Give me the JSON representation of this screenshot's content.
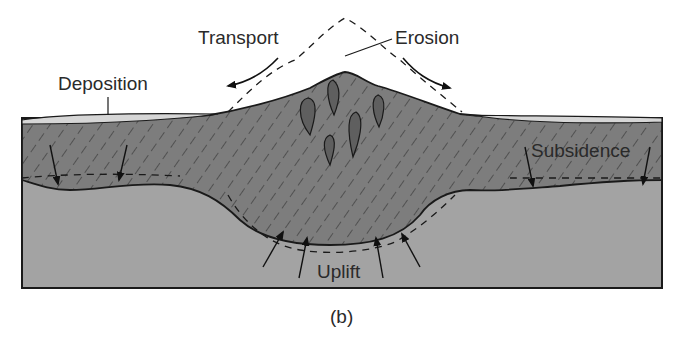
{
  "figure": {
    "caption": "(b)",
    "labels": {
      "transport": "Transport",
      "erosion": "Erosion",
      "deposition": "Deposition",
      "subsidence": "Subsidence",
      "uplift": "Uplift"
    },
    "layers": [
      {
        "name": "deposited-sediment",
        "color": "#d6d6d6"
      },
      {
        "name": "crustal-rock-hatched",
        "color": "#7d7d7d"
      },
      {
        "name": "lower-basement",
        "color": "#a3a3a3"
      },
      {
        "name": "intrusions",
        "color": "#5f5f5f"
      }
    ],
    "colors": {
      "outline": "#1a1a1a",
      "background": "#ffffff",
      "text": "#2a2a2a"
    }
  }
}
